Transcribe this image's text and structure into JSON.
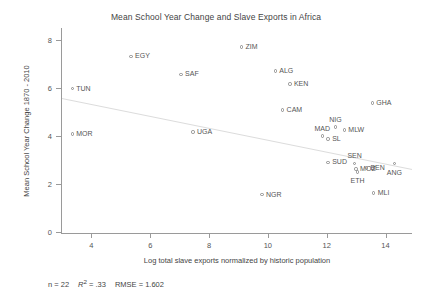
{
  "chart_data": {
    "type": "scatter",
    "title": "Mean School Year Change and Slave Exports in Africa",
    "xlabel": "Log total slave exports normalized by historic population",
    "ylabel": "Mean School Year Change 1870 - 2010",
    "xlim": [
      3.0,
      14.9
    ],
    "ylim": [
      0,
      8.4
    ],
    "xticks": [
      4,
      6,
      8,
      10,
      12,
      14
    ],
    "yticks": [
      0,
      2,
      4,
      6,
      8
    ],
    "grid": false,
    "legend": null,
    "marker": "open-circle",
    "points": [
      {
        "label": "TUN",
        "x": 3.35,
        "y": 5.96,
        "label_pos": "right"
      },
      {
        "label": "MOR",
        "x": 3.35,
        "y": 4.08,
        "label_pos": "right"
      },
      {
        "label": "EGY",
        "x": 5.35,
        "y": 7.3,
        "label_pos": "right"
      },
      {
        "label": "SAF",
        "x": 7.05,
        "y": 6.55,
        "label_pos": "right"
      },
      {
        "label": "UGA",
        "x": 7.45,
        "y": 4.16,
        "label_pos": "right"
      },
      {
        "label": "ZIM",
        "x": 9.1,
        "y": 7.7,
        "label_pos": "right"
      },
      {
        "label": "NGR",
        "x": 9.8,
        "y": 1.55,
        "label_pos": "right"
      },
      {
        "label": "ALG",
        "x": 10.25,
        "y": 6.7,
        "label_pos": "right"
      },
      {
        "label": "KEN",
        "x": 10.75,
        "y": 6.15,
        "label_pos": "right"
      },
      {
        "label": "CAM",
        "x": 10.5,
        "y": 5.08,
        "label_pos": "right"
      },
      {
        "label": "MAD",
        "x": 11.85,
        "y": 4.0,
        "label_pos": "above"
      },
      {
        "label": "SL",
        "x": 12.05,
        "y": 3.86,
        "label_pos": "right"
      },
      {
        "label": "NIG",
        "x": 12.3,
        "y": 4.36,
        "label_pos": "above"
      },
      {
        "label": "MLW",
        "x": 12.6,
        "y": 4.24,
        "label_pos": "right"
      },
      {
        "label": "SUD",
        "x": 12.05,
        "y": 2.9,
        "label_pos": "right"
      },
      {
        "label": "SEN",
        "x": 12.95,
        "y": 2.86,
        "label_pos": "above"
      },
      {
        "label": "MOZ",
        "x": 13.0,
        "y": 2.62,
        "label_pos": "right"
      },
      {
        "label": "ETH",
        "x": 13.05,
        "y": 2.5,
        "label_pos": "below"
      },
      {
        "label": "BEN",
        "x": 13.35,
        "y": 2.66,
        "label_pos": "right"
      },
      {
        "label": "GHA",
        "x": 13.55,
        "y": 5.36,
        "label_pos": "right"
      },
      {
        "label": "MLI",
        "x": 13.6,
        "y": 1.62,
        "label_pos": "right"
      },
      {
        "label": "ANG",
        "x": 14.3,
        "y": 2.84,
        "label_pos": "below"
      }
    ],
    "fit_line": {
      "x1": 3.0,
      "y1": 5.55,
      "x2": 14.9,
      "y2": 2.6
    },
    "annotations": {
      "n_label": "n = 22",
      "r2_label": "R",
      "r2_exponent": "2",
      "r2_value": "= .33",
      "rmse_label": "RMSE = 1.602"
    }
  },
  "colors": {
    "axis": "#9a9a9a",
    "marker": "#8c8c8c",
    "text": "#555555",
    "fit_line": "#dcdcdc"
  }
}
